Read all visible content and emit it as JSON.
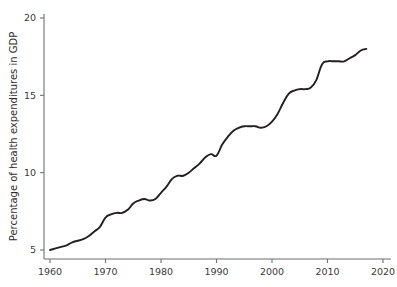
{
  "chart_data": {
    "type": "line",
    "title": "",
    "xlabel": "",
    "ylabel": "Percentage of health expenditures in GDP",
    "xlim": [
      1958,
      2021
    ],
    "ylim": [
      4.3,
      20.6
    ],
    "xticks": [
      1960,
      1970,
      1980,
      1990,
      2000,
      2010,
      2020
    ],
    "xtick_labels": [
      "1960",
      "1970",
      "1980",
      "1990",
      "2000",
      "2010",
      "2020"
    ],
    "yticks": [
      5,
      10,
      15,
      20
    ],
    "ytick_labels": [
      "5",
      "10",
      "15",
      "20"
    ],
    "grid": false,
    "legend": false,
    "line_color": "#231f20",
    "axis_color": "#6f6f6f",
    "series": [
      {
        "name": "Percentage of health expenditures in GDP",
        "x": [
          1960,
          1961,
          1962,
          1963,
          1964,
          1965,
          1966,
          1967,
          1968,
          1969,
          1970,
          1971,
          1972,
          1973,
          1974,
          1975,
          1976,
          1977,
          1978,
          1979,
          1980,
          1981,
          1982,
          1983,
          1984,
          1985,
          1986,
          1987,
          1988,
          1989,
          1990,
          1991,
          1992,
          1993,
          1994,
          1995,
          1996,
          1997,
          1998,
          1999,
          2000,
          2001,
          2002,
          2003,
          2004,
          2005,
          2006,
          2007,
          2008,
          2009,
          2010,
          2011,
          2012,
          2013,
          2014,
          2015,
          2016,
          2017
        ],
        "values": [
          5.0,
          5.1,
          5.2,
          5.3,
          5.5,
          5.6,
          5.7,
          5.9,
          6.2,
          6.5,
          7.1,
          7.3,
          7.4,
          7.4,
          7.6,
          8.0,
          8.2,
          8.3,
          8.2,
          8.3,
          8.7,
          9.1,
          9.6,
          9.8,
          9.8,
          10.0,
          10.3,
          10.6,
          11.0,
          11.2,
          11.1,
          11.8,
          12.3,
          12.7,
          12.9,
          13.0,
          13.0,
          13.0,
          12.9,
          13.0,
          13.3,
          13.8,
          14.5,
          15.1,
          15.3,
          15.4,
          15.4,
          15.5,
          16.0,
          17.0,
          17.2,
          17.2,
          17.2,
          17.2,
          17.4,
          17.6,
          17.9,
          18.0
        ]
      }
    ]
  },
  "axes": {
    "y_title": "Percentage of health expenditures in GDP"
  }
}
